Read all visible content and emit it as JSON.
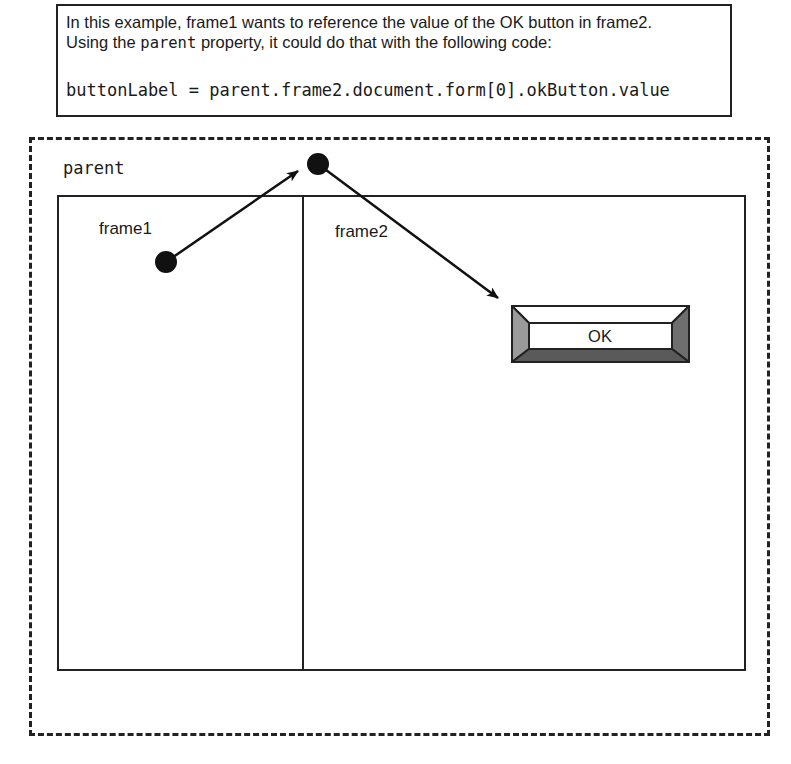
{
  "caption": {
    "line1": "In this example, frame1 wants to reference the value of the OK button in frame2.",
    "line2_before": "Using the ",
    "line2_code": "parent",
    "line2_after": " property, it could do that with the following code:",
    "code": "buttonLabel = parent.frame2.document.form[0].okButton.value"
  },
  "diagram": {
    "window_label": "parent",
    "frames": [
      {
        "label": "frame1"
      },
      {
        "label": "frame2"
      }
    ],
    "button": {
      "label": "OK"
    },
    "arrows": [
      {
        "from": "frame1",
        "to": "parent"
      },
      {
        "from": "parent",
        "to": "OK button"
      }
    ]
  }
}
